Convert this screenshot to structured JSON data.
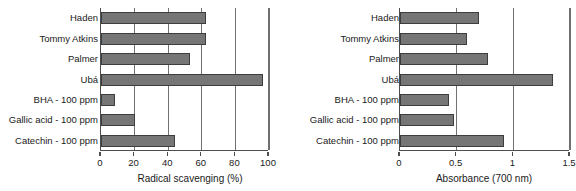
{
  "chart_data": [
    {
      "id": "radical-scavenging",
      "type": "bar",
      "orientation": "horizontal",
      "title": "",
      "xlabel": "Radical scavenging (%)",
      "ylabel": "",
      "xlim": [
        0,
        100
      ],
      "xticks": [
        0,
        20,
        40,
        60,
        80,
        100
      ],
      "xticklabels": [
        "0",
        "20",
        "40",
        "60",
        "80",
        "100"
      ],
      "grid": "vertical",
      "legend": "none",
      "bar_color": "#767676",
      "categories": [
        "Haden",
        "Tommy Atkins",
        "Palmer",
        "Ubá",
        "BHA - 100 ppm",
        "Gallic acid - 100 ppm",
        "Catechin - 100 ppm"
      ],
      "values": [
        62.5,
        62.5,
        53.0,
        96.5,
        8.5,
        20.0,
        44.0
      ]
    },
    {
      "id": "absorbance",
      "type": "bar",
      "orientation": "horizontal",
      "title": "",
      "xlabel": "Absorbance (700 nm)",
      "ylabel": "",
      "xlim": [
        0,
        1.5
      ],
      "xticks": [
        0,
        0.5,
        1,
        1.5
      ],
      "xticklabels": [
        "0",
        "0.5",
        "1",
        "1.5"
      ],
      "grid": "vertical",
      "legend": "none",
      "bar_color": "#767676",
      "categories": [
        "Haden",
        "Tommy Atkins",
        "Palmer",
        "Ubá",
        "BHA - 100 ppm",
        "Gallic acid - 100 ppm",
        "Catechin - 100 ppm"
      ],
      "values": [
        0.7,
        0.59,
        0.78,
        1.35,
        0.43,
        0.48,
        0.92
      ]
    }
  ]
}
